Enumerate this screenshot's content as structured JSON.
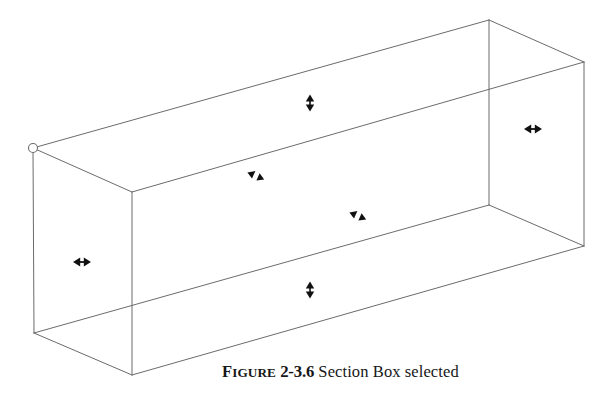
{
  "figure": {
    "caption": {
      "label_first_letter": "F",
      "label_rest": "IGURE",
      "number": "2-3.6",
      "text": "Section Box selected",
      "full": "FIGURE 2-3.6 Section Box selected"
    },
    "scene": {
      "title": "Section Box selected",
      "object_name": "section-box",
      "render_style": "wireframe",
      "background_color": "#ffffff",
      "line_color": "#6b6b6b",
      "line_width_px": 1,
      "handle_color": "#111111",
      "origin_marker_color": "#6b6b6b",
      "projection": "axonometric"
    },
    "vertices": {
      "top_left": {
        "x": 33,
        "y": 148
      },
      "top_back": {
        "x": 489,
        "y": 20
      },
      "top_right": {
        "x": 584,
        "y": 62
      },
      "top_front": {
        "x": 132,
        "y": 192
      },
      "bottom_left": {
        "x": 34,
        "y": 333
      },
      "bottom_back": {
        "x": 489,
        "y": 205
      },
      "bottom_right": {
        "x": 584,
        "y": 246
      },
      "bottom_front": {
        "x": 132,
        "y": 375
      }
    },
    "origin_marker": {
      "name": "origin-handle",
      "x": 33,
      "y": 148,
      "radius": 4.5
    },
    "handles": [
      {
        "name": "top-face-handle",
        "type": "arrow-up-down",
        "glyph": "↕",
        "x": 310,
        "y": 103,
        "rotation_deg": 0,
        "face": "top"
      },
      {
        "name": "right-face-handle",
        "type": "arrow-left-right",
        "glyph": "↔",
        "x": 533,
        "y": 129,
        "rotation_deg": 0,
        "face": "right-end"
      },
      {
        "name": "back-face-handle",
        "type": "arrow-diagonal",
        "glyph": "↖↘",
        "x": 256,
        "y": 176,
        "rotation_deg": 25,
        "face": "back"
      },
      {
        "name": "front-face-handle",
        "type": "arrow-diagonal",
        "glyph": "↖↘",
        "x": 358,
        "y": 216,
        "rotation_deg": 25,
        "face": "front"
      },
      {
        "name": "left-face-handle",
        "type": "arrow-left-right",
        "glyph": "↔",
        "x": 82,
        "y": 262,
        "rotation_deg": 0,
        "face": "left-end"
      },
      {
        "name": "bottom-face-handle",
        "type": "arrow-up-down",
        "glyph": "↕",
        "x": 310,
        "y": 290,
        "rotation_deg": 0,
        "face": "bottom"
      }
    ]
  }
}
